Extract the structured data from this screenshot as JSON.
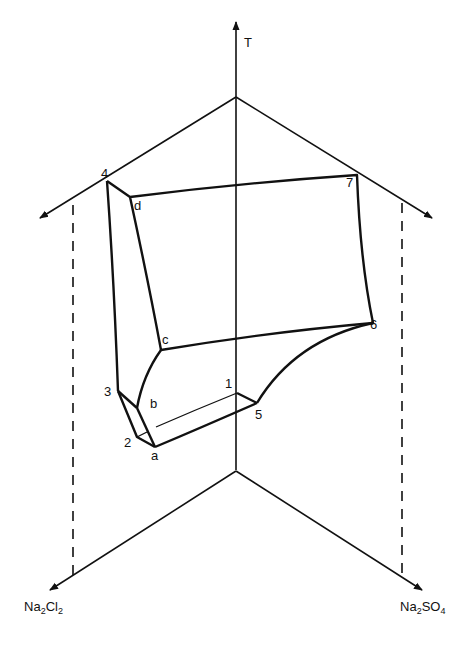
{
  "diagram": {
    "type": "ternary-phase-diagram-3d",
    "colors": {
      "ink": "#111111",
      "background": "#ffffff"
    },
    "axes": {
      "temperature": {
        "label": "T"
      },
      "left_component": {
        "base": "Na",
        "sub1": "2",
        "mid": "Cl",
        "sub2": "2"
      },
      "right_component": {
        "base": "Na",
        "sub1": "2",
        "mid": "SO",
        "sub2": "4"
      }
    },
    "points": {
      "p1": "1",
      "p2": "2",
      "p3": "3",
      "p4": "4",
      "p5": "5",
      "p6": "6",
      "p7": "7",
      "a": "a",
      "b": "b",
      "c": "c",
      "d": "d"
    }
  }
}
